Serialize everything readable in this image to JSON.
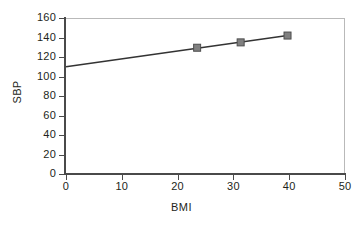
{
  "chart_data": {
    "type": "line",
    "title": "",
    "subtitle": "",
    "xlabel": "BMI",
    "ylabel": "SBP",
    "xlim": [
      0,
      50
    ],
    "ylim": [
      0,
      160
    ],
    "xticks": [
      0,
      10,
      20,
      30,
      40,
      50
    ],
    "yticks": [
      0,
      20,
      40,
      60,
      80,
      100,
      120,
      140,
      160
    ],
    "xtick_labels": [
      "0",
      "10",
      "20",
      "30",
      "40",
      "50"
    ],
    "ytick_labels": [
      "0",
      "20",
      "40",
      "60",
      "80",
      "100",
      "120",
      "140",
      "160"
    ],
    "grid": false,
    "legend": null,
    "legend_position": "none",
    "annotations": [],
    "series": [
      {
        "name": "SBP vs BMI",
        "type": "line",
        "line_color": "#333333",
        "marker": "square",
        "marker_color": "#808080",
        "marker_edge_color": "#4d4d4d",
        "x": [
          0,
          23.5,
          31.3,
          39.7
        ],
        "y": [
          110,
          129.5,
          135,
          142
        ],
        "marker_points": [
          {
            "x": 23.5,
            "y": 129.5
          },
          {
            "x": 31.3,
            "y": 135
          },
          {
            "x": 39.7,
            "y": 142
          }
        ],
        "line_endpoints": [
          {
            "x": 0,
            "y": 110
          },
          {
            "x": 39.7,
            "y": 142
          }
        ]
      }
    ]
  },
  "axes": {
    "x_title": "BMI",
    "y_title": "SBP"
  },
  "colors": {
    "axis": "#4a4a4a",
    "frame": "#b9b9b9",
    "line": "#333333",
    "marker_fill": "#808080",
    "marker_edge": "#4d4d4d",
    "text": "#231f20",
    "background": "#ffffff"
  }
}
